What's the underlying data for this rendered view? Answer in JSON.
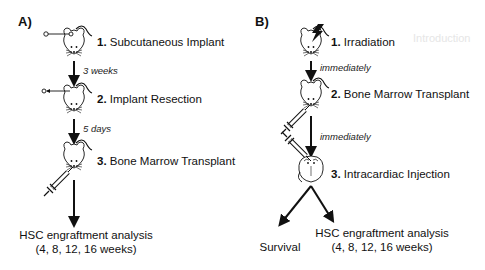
{
  "panels": [
    {
      "label": "A)",
      "steps": [
        {
          "number": "1.",
          "text": "Subcutaneous Implant"
        },
        {
          "number": "2.",
          "text": "Implant Resection"
        },
        {
          "number": "3.",
          "text": "Bone Marrow Transplant"
        }
      ],
      "intervals": [
        "3 weeks",
        "5 days"
      ],
      "outcome": {
        "line1": "HSC engraftment analysis",
        "line2": "(4, 8, 12, 16 weeks)"
      }
    },
    {
      "label": "B)",
      "steps": [
        {
          "number": "1.",
          "text": "Irradiation"
        },
        {
          "number": "2.",
          "text": "Bone Marrow Transplant"
        },
        {
          "number": "3.",
          "text": "Intracardiac Injection"
        }
      ],
      "intervals": [
        "immediately",
        "immediately"
      ],
      "outcomes": [
        {
          "line1": "Survival"
        },
        {
          "line1": "HSC engraftment analysis",
          "line2": "(4, 8, 12, 16 weeks)"
        }
      ]
    }
  ],
  "background_bleed": {
    "text": "Introduction"
  }
}
